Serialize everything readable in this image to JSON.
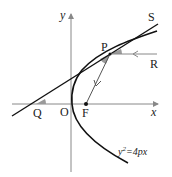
{
  "diagram": {
    "type": "parabola-reflection",
    "labels": {
      "x_axis": "x",
      "y_axis": "y",
      "origin": "O",
      "focus": "F",
      "point_p": "P",
      "point_q": "Q",
      "point_r": "R",
      "point_s": "S",
      "equation_base": "y",
      "equation_exp": "2",
      "equation_rest": "=4px"
    },
    "colors": {
      "curve": "#111111",
      "axis": "#888888",
      "angle_fill": "#9a9a9a",
      "text": "#222222"
    }
  }
}
